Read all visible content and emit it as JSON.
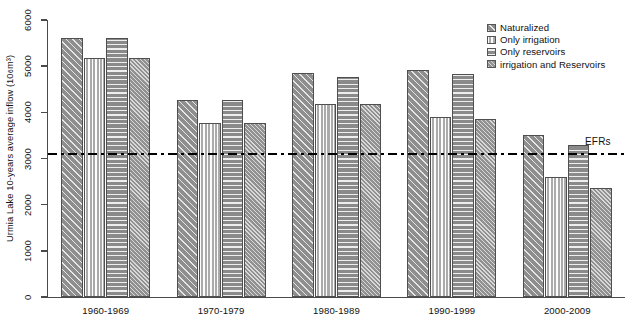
{
  "chart_data": {
    "type": "bar",
    "title": "",
    "xlabel": "",
    "ylabel": "Urmia Lake 10-years average inflow (10⁶m³)",
    "ylabel_main": "Urmia Lake 10-years average inflow (10",
    "ylabel_sup": "6",
    "ylabel_tail": "m³)",
    "categories": [
      "1960-1969",
      "1970-1979",
      "1980-1989",
      "1990-1999",
      "2000-2009"
    ],
    "series": [
      {
        "name": "Naturalized",
        "pattern": "diagonal-hatch-dark",
        "values": [
          5620,
          4260,
          4850,
          4920,
          3520
        ]
      },
      {
        "name": "Only irrigation",
        "pattern": "vertical-stripes-light",
        "values": [
          5180,
          3760,
          4180,
          3910,
          2590
        ]
      },
      {
        "name": "Only reservoirs",
        "pattern": "horizontal-stripes-dark",
        "values": [
          5620,
          4260,
          4760,
          4830,
          3300
        ]
      },
      {
        "name": "irrigation and Reservoirs",
        "pattern": "fine-diagonal-hatch-medium",
        "values": [
          5180,
          3760,
          4180,
          3850,
          2370
        ]
      }
    ],
    "ylim": [
      0,
      6000
    ],
    "yticks": [
      0,
      1000,
      2000,
      3000,
      4000,
      5000,
      6000
    ],
    "ytick_labels": [
      "0",
      "1000",
      "2000",
      "3000",
      "4000",
      "5000",
      "6000"
    ],
    "grid": false,
    "legend_position": "top-right",
    "annotations": [
      {
        "name": "EFRs",
        "label": "EFRs",
        "type": "horizontal-reference-line",
        "value": 3100,
        "linestyle": "dash-dot"
      }
    ]
  },
  "legend": {
    "items": [
      {
        "label": "Naturalized"
      },
      {
        "label": "Only irrigation"
      },
      {
        "label": "Only reservoirs"
      },
      {
        "label": "irrigation and Reservoirs"
      }
    ]
  },
  "colors": {
    "naturalized": "#8e8e8e",
    "only_irrigation": "#cfcfcf",
    "only_reservoirs": "#8a8a8a",
    "irrigation_and_reservoirs": "#9a9a9a",
    "axis": "#4a4a4a",
    "efr_line": "#000000",
    "background": "#ffffff"
  }
}
